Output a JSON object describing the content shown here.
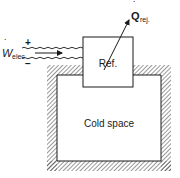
{
  "diagram": {
    "refrigerator_label": "Ref.",
    "cold_space_label": "Cold space",
    "work_input": {
      "symbol": "W",
      "subscript": "elec",
      "dot": "˙",
      "plus": "+",
      "minus": "−"
    },
    "heat_rejected": {
      "symbol": "Q",
      "subscript": "rej.",
      "dot": "˙"
    }
  },
  "colors": {
    "ink": "#1a1a1a",
    "background": "#ffffff"
  }
}
